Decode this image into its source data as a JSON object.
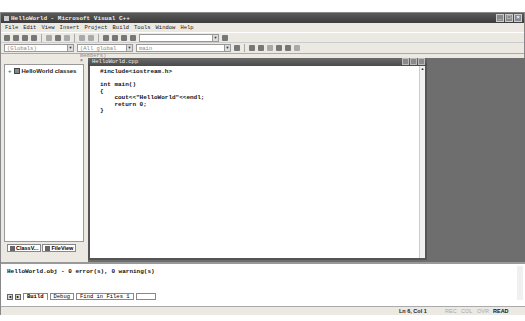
{
  "window": {
    "title": "HelloWorld - Microsoft Visual C++",
    "controls": [
      "minimize",
      "maximize",
      "close"
    ]
  },
  "menubar": {
    "items": [
      "File",
      "Edit",
      "View",
      "Insert",
      "Project",
      "Build",
      "Tools",
      "Window",
      "Help"
    ]
  },
  "toolbar": {
    "find_combo_value": "",
    "class_combo": "(Globals)",
    "member_combo": "(All global members)",
    "function_combo": "main"
  },
  "workspace": {
    "tree_items": [
      {
        "label": "HelloWorld classes",
        "expand": "+"
      }
    ],
    "tabs": [
      {
        "label": "ClassV...",
        "active": true
      },
      {
        "label": "FileView",
        "active": false
      }
    ]
  },
  "editor": {
    "title": "HelloWorld.cpp",
    "code_lines": [
      "#include<iostream.h>",
      "",
      "int main()",
      "{",
      "    cout<<\"HelloWorld\"<<endl;",
      "    return 0;",
      "}"
    ]
  },
  "output": {
    "lines": [
      "HelloWorld.obj - 0 error(s), 0 warning(s)",
      ""
    ],
    "tabs": [
      "Build",
      "Debug",
      "Find in Files 1",
      "Find in Files 2"
    ],
    "active_tab": "Build"
  },
  "statusbar": {
    "position": "Ln 6, Col 1",
    "indicators": [
      {
        "label": "REC",
        "active": false
      },
      {
        "label": "COL",
        "active": false
      },
      {
        "label": "OVR",
        "active": false
      },
      {
        "label": "READ",
        "active": true
      }
    ]
  }
}
